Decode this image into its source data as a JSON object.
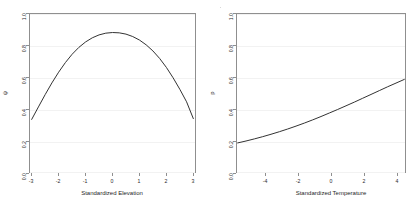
{
  "figure": {
    "background": "#ffffff",
    "curve_color": "#333333",
    "axis_color": "#8f8f8f",
    "grid_color": "#f2f2f2"
  },
  "panels": [
    {
      "id": "occupancy-elevation",
      "xlabel": "Standardized Elevation",
      "ylabel": "ψ",
      "xticks": [
        "-3",
        "-2",
        "-1",
        "0",
        "1",
        "2",
        "3"
      ],
      "xtick_values": [
        -3,
        -2,
        -1,
        0,
        1,
        2,
        3
      ],
      "yticks": [
        "0.0",
        "0.2",
        "0.4",
        "0.6",
        "0.8",
        "1.0"
      ],
      "ytick_values": [
        0.0,
        0.2,
        0.4,
        0.6,
        0.8,
        1.0
      ]
    },
    {
      "id": "detection-temperature",
      "xlabel": "Standardized Temperature",
      "ylabel": "p",
      "xticks": [
        "-4",
        "-2",
        "0",
        "2",
        "4"
      ],
      "xtick_values": [
        -4,
        -2,
        0,
        2,
        4
      ],
      "yticks": [
        "0.0",
        "0.2",
        "0.4",
        "0.6",
        "0.8",
        "1.0"
      ],
      "ytick_values": [
        0.0,
        0.2,
        0.4,
        0.6,
        0.8,
        1.0
      ]
    }
  ],
  "chart_data": [
    {
      "type": "line",
      "id": "occupancy-elevation",
      "title": "",
      "xlabel": "Standardized Elevation",
      "ylabel": "ψ",
      "xlim": [
        -3.1,
        3.1
      ],
      "ylim": [
        0.0,
        1.0
      ],
      "grid": true,
      "legend": "none",
      "series": [
        {
          "name": "psi",
          "x": [
            -3.0,
            -2.75,
            -2.5,
            -2.25,
            -2.0,
            -1.75,
            -1.5,
            -1.25,
            -1.0,
            -0.75,
            -0.5,
            -0.25,
            0.0,
            0.25,
            0.5,
            0.75,
            1.0,
            1.25,
            1.5,
            1.75,
            2.0,
            2.25,
            2.5,
            2.75,
            3.0
          ],
          "y": [
            0.335,
            0.413,
            0.49,
            0.563,
            0.63,
            0.69,
            0.742,
            0.785,
            0.819,
            0.845,
            0.863,
            0.874,
            0.878,
            0.876,
            0.868,
            0.853,
            0.831,
            0.801,
            0.763,
            0.716,
            0.66,
            0.595,
            0.523,
            0.445,
            0.34
          ]
        }
      ],
      "annotations": [
        "concave quadratic relationship, peak near x = 0.05, psi ≈ 0.88"
      ]
    },
    {
      "type": "line",
      "id": "detection-temperature",
      "title": "",
      "xlabel": "Standardized Temperature",
      "ylabel": "p",
      "xlim": [
        -5.1,
        5.1
      ],
      "ylim": [
        0.0,
        1.0
      ],
      "grid": true,
      "legend": "none",
      "series": [
        {
          "name": "p",
          "x": [
            -5.0,
            -4.5,
            -4.0,
            -3.5,
            -3.0,
            -2.5,
            -2.0,
            -1.5,
            -1.0,
            -0.5,
            0.0,
            0.5,
            1.0,
            1.5,
            2.0,
            2.5,
            3.0,
            3.5,
            4.0,
            4.5,
            5.0
          ],
          "y": [
            0.188,
            0.2,
            0.213,
            0.227,
            0.242,
            0.258,
            0.275,
            0.293,
            0.312,
            0.332,
            0.353,
            0.375,
            0.397,
            0.42,
            0.443,
            0.467,
            0.491,
            0.515,
            0.539,
            0.562,
            0.585
          ]
        }
      ],
      "annotations": [
        "monotonic increasing, slightly convex; p rises from 0.19 to 0.59"
      ]
    }
  ]
}
